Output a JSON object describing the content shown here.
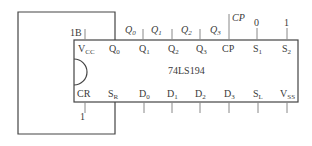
{
  "chip": {
    "name": "74LS194",
    "top_pins": [
      {
        "main": "V",
        "sub": "CC"
      },
      {
        "main": "Q",
        "sub": "0"
      },
      {
        "main": "Q",
        "sub": "1"
      },
      {
        "main": "Q",
        "sub": "2"
      },
      {
        "main": "Q",
        "sub": "3"
      },
      {
        "main": "CP",
        "sub": ""
      },
      {
        "main": "S",
        "sub": "1"
      },
      {
        "main": "S",
        "sub": "2"
      }
    ],
    "bottom_pins": [
      {
        "main": "CR",
        "sub": ""
      },
      {
        "main": "S",
        "sub": "R"
      },
      {
        "main": "D",
        "sub": "0"
      },
      {
        "main": "D",
        "sub": "1"
      },
      {
        "main": "D",
        "sub": "2"
      },
      {
        "main": "D",
        "sub": "3"
      },
      {
        "main": "S",
        "sub": "L"
      },
      {
        "main": "V",
        "sub": "SS"
      }
    ]
  },
  "external_labels": {
    "vcc_input": "1B",
    "q0_out": {
      "main": "Q",
      "sub": "0"
    },
    "q1_out": {
      "main": "Q",
      "sub": "1"
    },
    "q2_out": {
      "main": "Q",
      "sub": "2"
    },
    "q3_out": {
      "main": "Q",
      "sub": "3"
    },
    "clock": "CP",
    "s1_value": "0",
    "s2_value": "1",
    "cr_value": "1"
  },
  "colors": {
    "line": "#444444",
    "text": "#3a3a3a"
  }
}
